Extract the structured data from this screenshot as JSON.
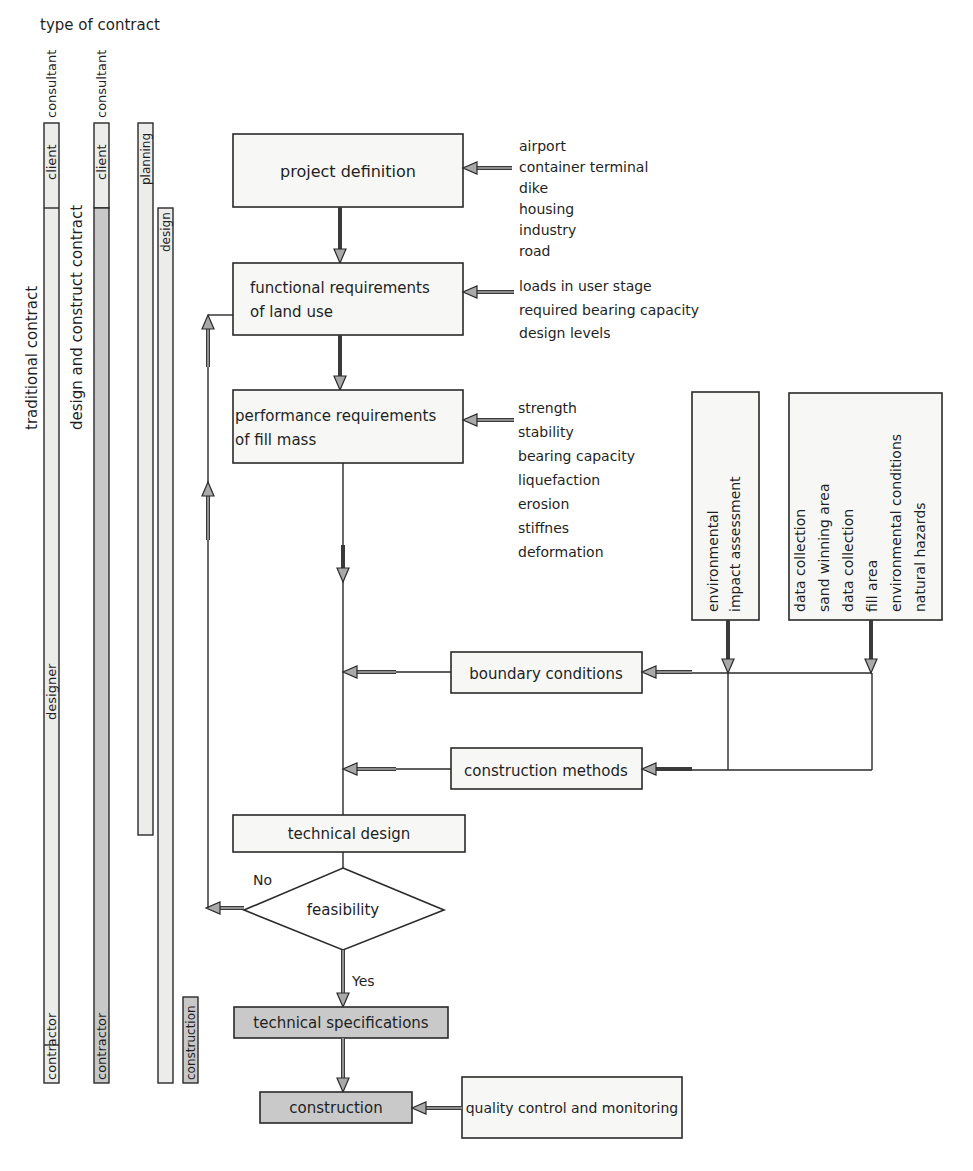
{
  "header": {
    "title": "type of contract"
  },
  "contract_columns": [
    {
      "label": "traditional contract",
      "segments": [
        {
          "label": "client"
        },
        {
          "label": "consultant"
        },
        {
          "label": "designer"
        },
        {
          "label": "contractor"
        }
      ]
    },
    {
      "label": "design and construct contract",
      "segments": [
        {
          "label": "client"
        },
        {
          "label": "consultant"
        },
        {
          "label": "contractor"
        }
      ]
    }
  ],
  "phases": [
    {
      "label": "planning"
    },
    {
      "label": "design"
    },
    {
      "label": "construction"
    }
  ],
  "flow": {
    "project_definition": "project definition",
    "functional_requirements": [
      "functional requirements",
      "of land use"
    ],
    "performance_requirements": [
      "performance requirements",
      "of fill mass"
    ],
    "boundary_conditions": "boundary conditions",
    "construction_methods": "construction methods",
    "technical_design": "technical design",
    "feasibility": "feasibility",
    "no_label": "No",
    "yes_label": "Yes",
    "technical_specifications": "technical specifications",
    "construction": "construction",
    "quality_control": "quality control and monitoring"
  },
  "inputs": {
    "project_types": [
      "airport",
      "container terminal",
      "dike",
      "housing",
      "industry",
      "road"
    ],
    "functional": [
      "loads in user stage",
      "required bearing capacity",
      "design levels"
    ],
    "performance": [
      "strength",
      "stability",
      "bearing capacity",
      "liquefaction",
      "erosion",
      "stiffnes",
      "deformation"
    ],
    "environmental": [
      "environmental",
      "impact assessment"
    ],
    "data": [
      "data collection",
      "sand winning area",
      "data collection",
      "fill area",
      "environmental conditions",
      "natural hazards"
    ]
  },
  "colors": {
    "box_fill": "#f7f7f6",
    "grey_fill": "#c9c9c9",
    "bar_light": "#ececeb",
    "bar_dark": "#c8c8c8",
    "arrow_fill": "#a9a9a9",
    "stroke": "#2a2a2a"
  }
}
